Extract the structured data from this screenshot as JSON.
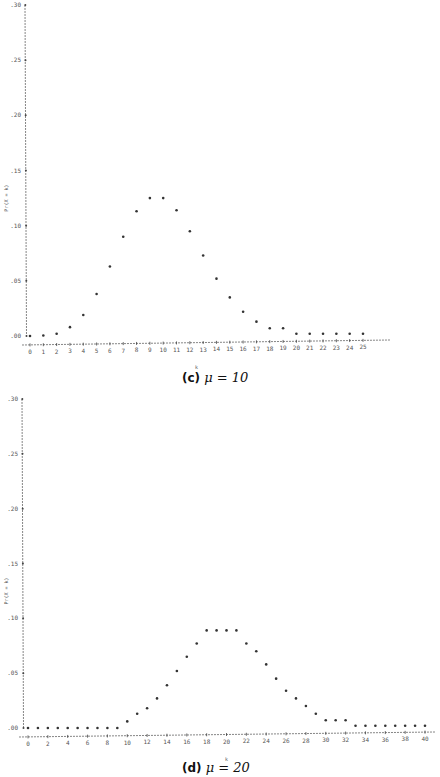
{
  "chart_data": [
    {
      "type": "scatter",
      "title": "(c) μ = 10",
      "caption_label": "(c)",
      "caption_math": "μ = 10",
      "xlabel": "k",
      "ylabel": "Pr(X = k)",
      "yticks": [
        ".00",
        ".05",
        ".10",
        ".15",
        ".20",
        ".25",
        ".30"
      ],
      "xticks": [
        "0",
        "1",
        "2",
        "3",
        "4",
        "5",
        "6",
        "7",
        "8",
        "9",
        "10",
        "11",
        "12",
        "13",
        "14",
        "15",
        "16",
        "17",
        "18",
        "19",
        "20",
        "21",
        "22",
        "23",
        "24",
        "25"
      ],
      "ylim": [
        0,
        0.3
      ],
      "xlim": [
        0,
        25
      ],
      "x": [
        0,
        1,
        2,
        3,
        4,
        5,
        6,
        7,
        8,
        9,
        10,
        11,
        12,
        13,
        14,
        15,
        16,
        17,
        18,
        19,
        20,
        21,
        22,
        23,
        24,
        25
      ],
      "values": [
        0.0,
        0.0005,
        0.002,
        0.008,
        0.019,
        0.038,
        0.063,
        0.09,
        0.113,
        0.125,
        0.125,
        0.114,
        0.095,
        0.073,
        0.052,
        0.035,
        0.022,
        0.013,
        0.007,
        0.007,
        0.002,
        0.002,
        0.002,
        0.002,
        0.002,
        0.002
      ],
      "grid": false
    },
    {
      "type": "scatter",
      "title": "(d) μ = 20",
      "caption_label": "(d)",
      "caption_math": "μ = 20",
      "xlabel": "k",
      "ylabel": "Pr(X = k)",
      "yticks": [
        ".00",
        ".05",
        ".10",
        ".15",
        ".20",
        ".25",
        ".30"
      ],
      "xticks": [
        "0",
        "2",
        "4",
        "6",
        "8",
        "10",
        "12",
        "14",
        "16",
        "18",
        "20",
        "22",
        "24",
        "26",
        "28",
        "30",
        "32",
        "34",
        "36",
        "38",
        "40"
      ],
      "ylim": [
        0,
        0.3
      ],
      "xlim": [
        0,
        40
      ],
      "x": [
        0,
        1,
        2,
        3,
        4,
        5,
        6,
        7,
        8,
        9,
        10,
        11,
        12,
        13,
        14,
        15,
        16,
        17,
        18,
        19,
        20,
        21,
        22,
        23,
        24,
        25,
        26,
        27,
        28,
        29,
        30,
        31,
        32,
        33,
        34,
        35,
        36,
        37,
        38,
        39,
        40
      ],
      "values": [
        0.0,
        0.0,
        0.0,
        0.0,
        0.0,
        0.0,
        0.0,
        0.0,
        0.0,
        0.0,
        0.006,
        0.013,
        0.018,
        0.027,
        0.039,
        0.052,
        0.065,
        0.077,
        0.089,
        0.089,
        0.089,
        0.089,
        0.077,
        0.07,
        0.058,
        0.045,
        0.034,
        0.027,
        0.02,
        0.013,
        0.007,
        0.007,
        0.007,
        0.002,
        0.002,
        0.002,
        0.002,
        0.002,
        0.002,
        0.002,
        0.002
      ],
      "grid": false
    }
  ]
}
